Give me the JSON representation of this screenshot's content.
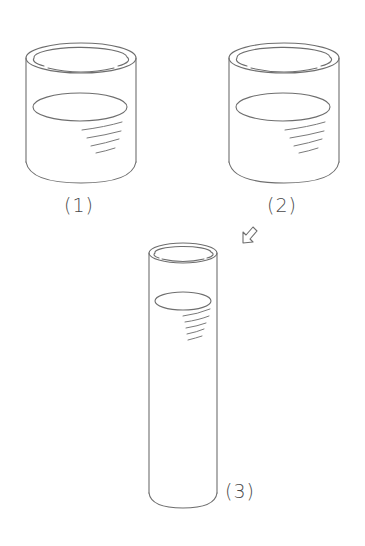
{
  "figure": {
    "stroke_color": "#6e6e6e",
    "label_color": "#4a4a4a",
    "background": "#ffffff"
  },
  "containers": [
    {
      "id": "beaker-1",
      "label": "(1)",
      "shape": "wide beaker",
      "liquid_level": "about half full"
    },
    {
      "id": "beaker-2",
      "label": "(2)",
      "shape": "wide beaker",
      "liquid_level": "about half full"
    },
    {
      "id": "cylinder-3",
      "label": "(3)",
      "shape": "tall narrow cylinder",
      "liquid_level": "near top"
    }
  ],
  "arrow": {
    "icon": "hollow-arrow-down-left-icon",
    "from": "(2)",
    "to": "(3)"
  }
}
